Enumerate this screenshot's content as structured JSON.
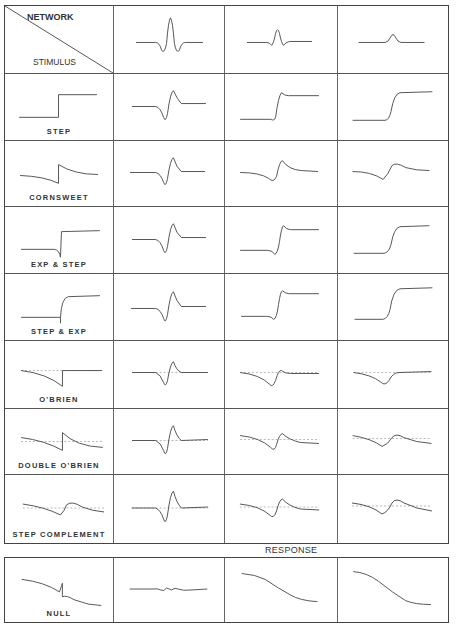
{
  "header": {
    "network_label": "NETWORK",
    "stimulus_label": "STIMULUS"
  },
  "response_label": "RESPONSE",
  "rows": [
    {
      "label": "STEP"
    },
    {
      "label": "CORNSWEET"
    },
    {
      "label": "EXP & STEP"
    },
    {
      "label": "STEP & EXP"
    },
    {
      "label": "O'BRIEN"
    },
    {
      "label": "DOUBLE O'BRIEN"
    },
    {
      "label": "STEP COMPLEMENT"
    }
  ],
  "null_row": {
    "label": "NULL"
  },
  "networks": [
    {
      "name": "narrow-dog-network"
    },
    {
      "name": "medium-dog-network"
    },
    {
      "name": "wide-gaussian-network"
    }
  ],
  "colors": {
    "line": "#555555",
    "grid": "#444444",
    "reference": "#999999"
  }
}
